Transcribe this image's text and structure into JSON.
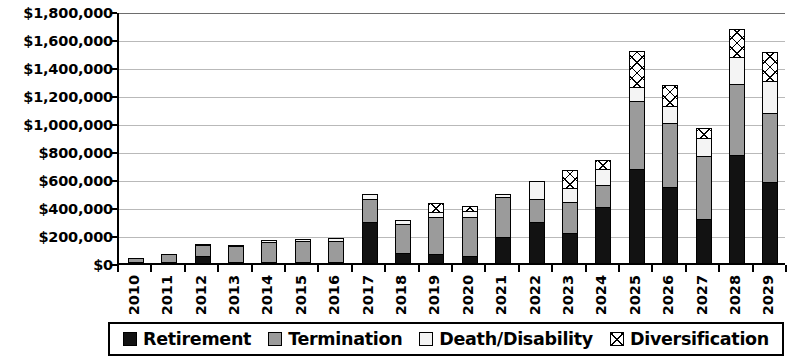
{
  "chart_data": {
    "type": "bar",
    "stacked": true,
    "title": "",
    "subtitle": "",
    "xlabel": "",
    "ylabel": "",
    "ylim": [
      0,
      1800000
    ],
    "ytick_step": 200000,
    "grid": true,
    "legend_position": "bottom",
    "y_tick_labels": [
      "$1,800,000",
      "$1,600,000",
      "$1,400,000",
      "$1,200,000",
      "$1,000,000",
      "$800,000",
      "$600,000",
      "$400,000",
      "$200,000",
      "$0"
    ],
    "y_tick_values": [
      1800000,
      1600000,
      1400000,
      1200000,
      1000000,
      800000,
      600000,
      400000,
      200000,
      0
    ],
    "categories": [
      "2010",
      "2011",
      "2012",
      "2013",
      "2014",
      "2015",
      "2016",
      "2017",
      "2018",
      "2019",
      "2020",
      "2021",
      "2022",
      "2023",
      "2024",
      "2025",
      "2026",
      "2027",
      "2028",
      "2029"
    ],
    "series": [
      {
        "name": "Retirement",
        "color": "#121212",
        "pattern": "solid-black",
        "values": [
          15000,
          5000,
          55000,
          10000,
          10000,
          5000,
          5000,
          300000,
          80000,
          75000,
          60000,
          195000,
          300000,
          220000,
          405000,
          680000,
          550000,
          320000,
          780000,
          585000
        ]
      },
      {
        "name": "Termination",
        "color": "#9b9b9b",
        "pattern": "solid-gray",
        "values": [
          35000,
          65000,
          90000,
          125000,
          150000,
          155000,
          160000,
          175000,
          215000,
          265000,
          280000,
          290000,
          175000,
          230000,
          165000,
          490000,
          465000,
          460000,
          510000,
          500000
        ]
      },
      {
        "name": "Death/Disability",
        "color": "#f4f4f4",
        "pattern": "solid-white",
        "values": [
          10000,
          10000,
          10000,
          10000,
          20000,
          25000,
          25000,
          40000,
          35000,
          45000,
          55000,
          30000,
          130000,
          105000,
          120000,
          110000,
          125000,
          135000,
          200000,
          235000
        ]
      },
      {
        "name": "Diversification",
        "color": "#ffffff",
        "pattern": "crosshatch",
        "values": [
          0,
          0,
          0,
          0,
          0,
          0,
          0,
          0,
          0,
          75000,
          40000,
          0,
          0,
          135000,
          75000,
          265000,
          160000,
          80000,
          210000,
          215000
        ]
      }
    ],
    "totals": [
      60000,
      80000,
      155000,
      145000,
      180000,
      185000,
      190000,
      515000,
      330000,
      460000,
      435000,
      515000,
      605000,
      690000,
      765000,
      1545000,
      1300000,
      995000,
      1700000,
      1535000
    ]
  },
  "legend": {
    "items": [
      {
        "label": "Retirement",
        "swatch": "solid-black"
      },
      {
        "label": "Termination",
        "swatch": "solid-gray"
      },
      {
        "label": "Death/Disability",
        "swatch": "solid-white"
      },
      {
        "label": "Diversification",
        "swatch": "crosshatch"
      }
    ]
  }
}
